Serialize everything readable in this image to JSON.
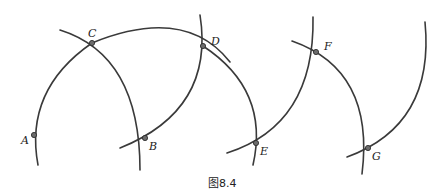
{
  "caption": "图8.4",
  "colors": {
    "stroke": "#3a3a3a",
    "point_fill": "#6b6b6b",
    "background": "#ffffff"
  },
  "points": [
    {
      "name": "A",
      "x": 34,
      "y": 135,
      "label_x": 21,
      "label_y": 144
    },
    {
      "name": "B",
      "x": 145,
      "y": 138,
      "label_x": 149,
      "label_y": 150
    },
    {
      "name": "C",
      "x": 92,
      "y": 43,
      "label_x": 88,
      "label_y": 37
    },
    {
      "name": "D",
      "x": 203,
      "y": 46,
      "label_x": 211,
      "label_y": 45
    },
    {
      "name": "E",
      "x": 256,
      "y": 143,
      "label_x": 260,
      "label_y": 155
    },
    {
      "name": "F",
      "x": 316,
      "y": 52,
      "label_x": 324,
      "label_y": 50
    },
    {
      "name": "G",
      "x": 368,
      "y": 148,
      "label_x": 372,
      "label_y": 160
    }
  ],
  "arcs": [
    {
      "id": "arc-A-C",
      "d": "M 38 165 Q 24 90 92 43"
    },
    {
      "id": "arc-C-B",
      "d": "M 60 30 Q 140 55 140 170"
    },
    {
      "id": "arc-C-D-E",
      "d": "M 92 43 Q 185 5 230 62"
    },
    {
      "id": "arc-D-B",
      "d": "M 200 15 Q 215 110 120 148"
    },
    {
      "id": "arc-D-E",
      "d": "M 203 46 Q 270 90 253 165"
    },
    {
      "id": "arc-E-F",
      "d": "M 227 153 Q 315 125 313 17"
    },
    {
      "id": "arc-F-G",
      "d": "M 292 41 Q 375 70 362 174"
    },
    {
      "id": "arc-G-top",
      "d": "M 347 157 Q 435 125 425 22"
    }
  ]
}
